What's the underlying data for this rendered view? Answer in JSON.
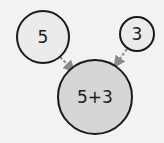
{
  "diagram": {
    "background": "#f2f2f2",
    "nodes": [
      {
        "id": "five",
        "label": "5",
        "cx": 43,
        "cy": 37,
        "r": 26,
        "fill": "#ebebeb",
        "stroke": "#1a1a1a"
      },
      {
        "id": "three",
        "label": "3",
        "cx": 137,
        "cy": 34,
        "r": 17,
        "fill": "#ebebeb",
        "stroke": "#1a1a1a"
      },
      {
        "id": "sum",
        "label": "5+3",
        "cx": 95,
        "cy": 97,
        "r": 37,
        "fill": "#d6d6d6",
        "stroke": "#1a1a1a"
      }
    ],
    "edges": [
      {
        "from": "five",
        "to": "sum",
        "style": "dashed",
        "color": "#8a8a8a"
      },
      {
        "from": "three",
        "to": "sum",
        "style": "dashed",
        "color": "#8a8a8a"
      }
    ]
  }
}
